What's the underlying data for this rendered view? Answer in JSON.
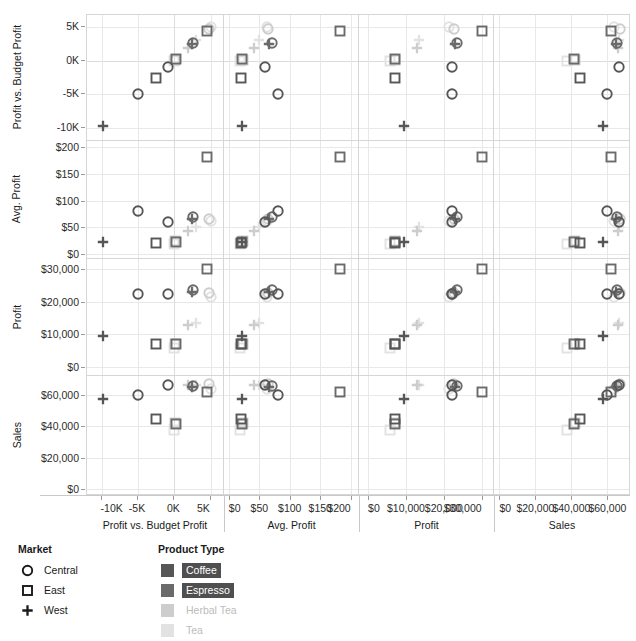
{
  "chart_data": {
    "type": "scatter",
    "title": "",
    "variables": [
      "Profit vs. Budget Profit",
      "Avg. Profit",
      "Profit",
      "Sales"
    ],
    "row_labels": [
      "Profit vs. Budget Profit",
      "Avg. Profit",
      "Profit",
      "Sales"
    ],
    "col_labels": [
      "Profit vs. Budget Profit",
      "Avg. Profit",
      "Profit",
      "Sales"
    ],
    "grid": true,
    "legend_position": "bottom-left",
    "axes": {
      "Profit vs. Budget Profit": {
        "ticks": [
          -10000,
          -5000,
          0,
          5000
        ],
        "tick_labels": [
          "-10K",
          "-5K",
          "0K",
          "5K"
        ],
        "range": [
          -12000,
          6800
        ],
        "label": "Profit vs. Budget Profit"
      },
      "Avg. Profit": {
        "ticks": [
          0,
          50,
          100,
          150,
          200
        ],
        "tick_labels": [
          "$0",
          "$50",
          "$100",
          "$150",
          "$200"
        ],
        "range": [
          -8,
          212
        ],
        "label": "Avg. Profit"
      },
      "Profit": {
        "ticks": [
          0,
          10000,
          20000,
          30000
        ],
        "tick_labels": [
          "$0",
          "$10,000",
          "$20,000",
          "$30,000"
        ],
        "range": [
          -2400,
          33000
        ],
        "label": "Profit"
      },
      "Sales": {
        "ticks": [
          0,
          20000,
          40000,
          60000
        ],
        "tick_labels": [
          "$0",
          "$20,000",
          "$40,000",
          "$60,000"
        ],
        "range": [
          -3000,
          72000
        ],
        "label": "Sales"
      }
    },
    "marks": {
      "Central": "circle",
      "East": "square",
      "West": "plus"
    },
    "points": [
      {
        "market": "West",
        "product": "Coffee",
        "pvb": -9800,
        "avgprofit": 22,
        "profit": 9500,
        "sales": 57500
      },
      {
        "market": "Central",
        "product": "Coffee",
        "pvb": -5050,
        "avgprofit": 80,
        "profit": 22300,
        "sales": 59800
      },
      {
        "market": "East",
        "product": "Coffee",
        "pvb": -2600,
        "avgprofit": 20,
        "profit": 7100,
        "sales": 44500
      },
      {
        "market": "Central",
        "product": "Coffee",
        "pvb": -950,
        "avgprofit": 59,
        "profit": 22200,
        "sales": 66200
      },
      {
        "market": "East",
        "product": "Espresso",
        "pvb": 250,
        "avgprofit": 22,
        "profit": 7000,
        "sales": 41500
      },
      {
        "market": "West",
        "product": "Espresso",
        "pvb": 2400,
        "avgprofit": 66,
        "profit": 22900,
        "sales": 65000
      },
      {
        "market": "Central",
        "product": "Espresso",
        "pvb": 2550,
        "avgprofit": 70,
        "profit": 23500,
        "sales": 65400
      },
      {
        "market": "East",
        "product": "Espresso",
        "pvb": 4400,
        "avgprofit": 182,
        "profit": 30100,
        "sales": 62000
      },
      {
        "market": "Central",
        "product": "Herbal Tea",
        "pvb": 4700,
        "avgprofit": 65,
        "profit": 22600,
        "sales": 67000
      },
      {
        "market": "West",
        "product": "Herbal Tea",
        "pvb": 1900,
        "avgprofit": 42,
        "profit": 13000,
        "sales": 66000
      },
      {
        "market": "East",
        "product": "Herbal Tea",
        "pvb": 50,
        "avgprofit": 24,
        "profit": 7200,
        "sales": 42000
      },
      {
        "market": "West",
        "product": "Tea",
        "pvb": 3000,
        "avgprofit": 50,
        "profit": 13500,
        "sales": 66500
      },
      {
        "market": "East",
        "product": "Tea",
        "pvb": -100,
        "avgprofit": 18,
        "profit": 5800,
        "sales": 37500
      },
      {
        "market": "Central",
        "product": "Tea",
        "pvb": 5000,
        "avgprofit": 62,
        "profit": 21500,
        "sales": 63500
      }
    ]
  },
  "legends": {
    "market": {
      "title": "Market",
      "items": [
        {
          "label": "Central",
          "glyph": "circle-mark-icon"
        },
        {
          "label": "East",
          "glyph": "square-mark-icon"
        },
        {
          "label": "West",
          "glyph": "plus-mark-icon"
        }
      ]
    },
    "product_type": {
      "title": "Product Type",
      "items": [
        {
          "label": "Coffee",
          "color": "#565656",
          "selected": true
        },
        {
          "label": "Espresso",
          "color": "#6a6a6a",
          "selected": true
        },
        {
          "label": "Herbal Tea",
          "color": "#cdcdcd",
          "selected": false
        },
        {
          "label": "Tea",
          "color": "#e2e2e2",
          "selected": false
        }
      ]
    }
  },
  "colors": {
    "coffee": "#565656",
    "espresso": "#6a6a6a",
    "herbal_tea": "#cdcdcd",
    "tea": "#e2e2e2",
    "gridline": "#e8e8e8",
    "panel_border": "#d6d6d6",
    "text": "#1a1a1a",
    "highlight_bg": "#4f4f4f"
  }
}
